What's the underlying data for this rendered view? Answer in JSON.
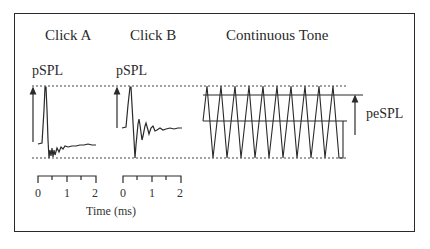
{
  "diagram": {
    "titles": {
      "click_a": "Click A",
      "click_b": "Click B",
      "tone": "Continuous Tone"
    },
    "measures": {
      "pspl_a": "pSPL",
      "pspl_b": "pSPL",
      "pespl": "peSPL"
    },
    "timescale": {
      "a_ticks": [
        "0",
        "1",
        "2"
      ],
      "b_ticks": [
        "0",
        "1",
        "2"
      ],
      "axis_label": "Time (ms)"
    },
    "colors": {
      "stroke": "#2a2a2a",
      "background": "#ffffff"
    }
  }
}
